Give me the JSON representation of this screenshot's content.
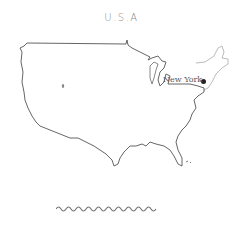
{
  "map": {
    "title": "U.S.A",
    "country": "United States",
    "outline_color": "#555555",
    "neighbor_outline_color": "#aaaaaa",
    "markers": [
      {
        "label": "New York",
        "dot_color": "#222222"
      }
    ]
  }
}
